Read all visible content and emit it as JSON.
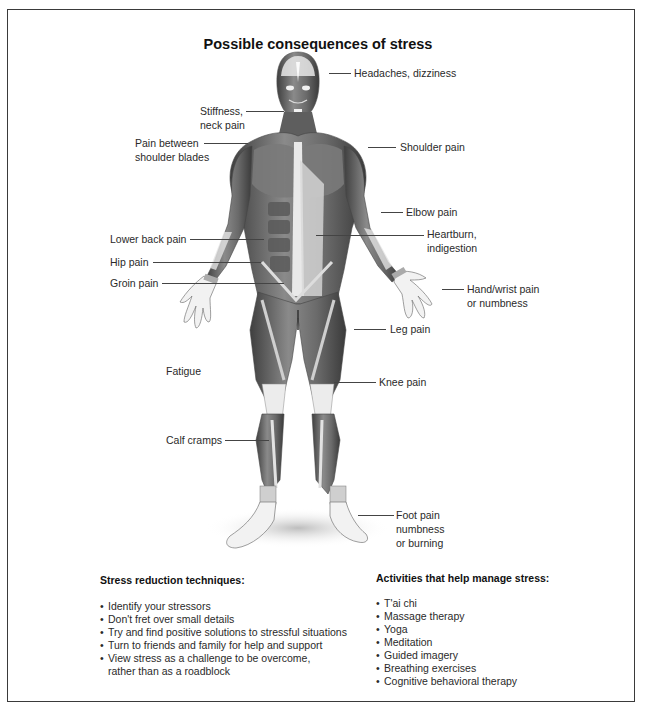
{
  "title": "Possible consequences of stress",
  "labels": {
    "headaches": "Headaches, dizziness",
    "stiffness_1": "Stiffness,",
    "stiffness_2": "neck pain",
    "between_1": "Pain between",
    "between_2": "shoulder blades",
    "shoulder": "Shoulder pain",
    "elbow": "Elbow pain",
    "lower_back": "Lower back pain",
    "heartburn_1": "Heartburn,",
    "heartburn_2": "indigestion",
    "hip": "Hip pain",
    "groin": "Groin pain",
    "hand_1": "Hand/wrist pain",
    "hand_2": "or numbness",
    "leg": "Leg pain",
    "fatigue": "Fatigue",
    "knee": "Knee pain",
    "calf": "Calf cramps",
    "foot_1": "Foot pain",
    "foot_2": "numbness",
    "foot_3": "or burning"
  },
  "stress_reduction": {
    "heading": "Stress reduction techniques:",
    "bullet": "•",
    "items": [
      "Identify your stressors",
      "Don't fret over small details",
      "Try and find positive solutions to stressful situations",
      "Turn to friends and family for help and support",
      "View stress as a challenge to be overcome,"
    ],
    "continuation": "rather than as a roadblock"
  },
  "activities": {
    "heading": "Activities that help manage stress:",
    "bullet": "•",
    "items": [
      "T'ai chi",
      "Massage therapy",
      "Yoga",
      "Meditation",
      "Guided imagery",
      "Breathing exercises",
      "Cognitive behavioral therapy"
    ]
  },
  "colors": {
    "border": "#3a3a3a",
    "muscle_dark": "#4a4a4a",
    "muscle_mid": "#7a7a7a",
    "tendon": "#e6e6e6"
  }
}
